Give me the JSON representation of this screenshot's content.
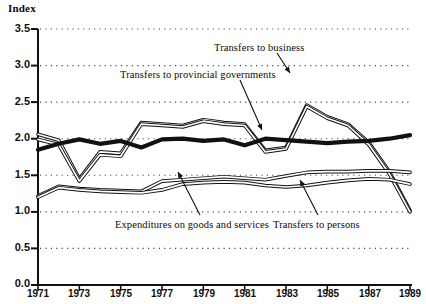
{
  "chart_data": {
    "type": "line",
    "title": "",
    "ylabel": "Index",
    "xlabel": "",
    "ylim": [
      0.0,
      3.5
    ],
    "xlim": [
      1971,
      1989
    ],
    "grid": "horizontal-dotted",
    "legend": "inline-annotations",
    "x": [
      1971,
      1972,
      1973,
      1974,
      1975,
      1976,
      1977,
      1978,
      1979,
      1980,
      1981,
      1982,
      1983,
      1984,
      1985,
      1986,
      1987,
      1988,
      1989
    ],
    "ytick_labels": [
      "0.0",
      "0.5",
      "1.0",
      "1.5",
      "2.0",
      "2.5",
      "3.0",
      "3.5"
    ],
    "ytick_values": [
      0.0,
      0.5,
      1.0,
      1.5,
      2.0,
      2.5,
      3.0,
      3.5
    ],
    "xtick_labels": [
      "1971",
      "1973",
      "1975",
      "1977",
      "1979",
      "1981",
      "1983",
      "1985",
      "1987",
      "1989"
    ],
    "xtick_values": [
      1971,
      1973,
      1975,
      1977,
      1979,
      1981,
      1983,
      1985,
      1987,
      1989
    ],
    "series": [
      {
        "name": "Transfers to provincial governments",
        "style": "thin-outline",
        "label_x": 120,
        "label_y": 73,
        "values": [
          2.06,
          1.98,
          1.45,
          1.82,
          1.8,
          2.22,
          2.2,
          2.18,
          2.26,
          2.22,
          2.2,
          1.84,
          1.88,
          2.46,
          2.3,
          2.2,
          1.95,
          1.55,
          1.02
        ]
      },
      {
        "name": "Transfers to business",
        "style": "thin-outline",
        "label_x": 214,
        "label_y": 47,
        "values": [
          1.99,
          1.92,
          1.42,
          1.78,
          1.76,
          2.2,
          2.18,
          2.16,
          2.24,
          2.2,
          2.18,
          1.82,
          1.86,
          2.44,
          2.28,
          2.18,
          1.92,
          1.52,
          1.0
        ]
      },
      {
        "name": "Expenditures on goods and services",
        "style": "thick-black",
        "label_x": 115,
        "label_y": 224,
        "values": [
          1.85,
          1.93,
          1.99,
          1.93,
          1.97,
          1.88,
          1.99,
          2.0,
          1.97,
          1.99,
          1.91,
          2.0,
          1.98,
          1.96,
          1.94,
          1.96,
          1.97,
          2.0,
          2.05
        ]
      },
      {
        "name": "Transfers to persons",
        "style": "thin-outline",
        "label_x": 273,
        "label_y": 224,
        "values": [
          1.22,
          1.35,
          1.32,
          1.3,
          1.29,
          1.28,
          1.42,
          1.44,
          1.46,
          1.48,
          1.46,
          1.44,
          1.49,
          1.54,
          1.55,
          1.55,
          1.56,
          1.56,
          1.54
        ]
      },
      {
        "name": "Expenditures on goods and services (lower band)",
        "style": "thin-outline",
        "label_x": 0,
        "label_y": 0,
        "values": [
          1.2,
          1.33,
          1.3,
          1.28,
          1.27,
          1.26,
          1.3,
          1.38,
          1.4,
          1.41,
          1.4,
          1.36,
          1.34,
          1.36,
          1.4,
          1.43,
          1.45,
          1.44,
          1.38
        ]
      }
    ],
    "annotations": [
      {
        "text": "Transfers to business",
        "arrow_from_x": 277,
        "arrow_from_y": 53,
        "arrow_to_x": 290,
        "arrow_to_y": 73
      },
      {
        "text": "Transfers to provincial governments",
        "arrow_from_x": 240,
        "arrow_from_y": 80,
        "arrow_to_x": 262,
        "arrow_to_y": 130
      },
      {
        "text": "Expenditures on goods and services",
        "arrow_from_x": 200,
        "arrow_from_y": 215,
        "arrow_to_x": 178,
        "arrow_to_y": 172
      },
      {
        "text": "Transfers to persons",
        "arrow_from_x": 318,
        "arrow_from_y": 215,
        "arrow_to_x": 300,
        "arrow_to_y": 180
      }
    ]
  },
  "labels": {
    "y_axis_title": "Index",
    "series_business": "Transfers to business",
    "series_provincial": "Transfers to provincial governments",
    "series_goods": "Expenditures on goods and services",
    "series_persons": "Transfers to persons"
  },
  "colors": {
    "line": "#111111",
    "grid": "#4a4a4a",
    "axis": "#111111",
    "background": "#ffffff"
  }
}
